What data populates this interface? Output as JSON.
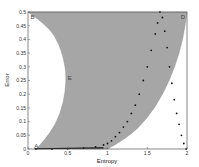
{
  "chart_data": {
    "type": "scatter",
    "title": "",
    "xlabel": "Entropy",
    "ylabel": "Error",
    "xlim": [
      0,
      2
    ],
    "ylim": [
      0,
      0.5
    ],
    "grid": false,
    "xticks": [
      "0",
      "0.5",
      "1",
      "1.5",
      "2"
    ],
    "yticks": [
      "0",
      "0.05",
      "0.1",
      "0.15",
      "0.2",
      "0.25",
      "0.3",
      "0.35",
      "0.4",
      "0.45",
      "0.5"
    ],
    "region": {
      "name": "feasible region",
      "color": "#a6a6a6",
      "left_boundary": [
        [
          0,
          0.5
        ],
        [
          0.25,
          0.45
        ],
        [
          0.4,
          0.38
        ],
        [
          0.47,
          0.3
        ],
        [
          0.48,
          0.25
        ],
        [
          0.45,
          0.17
        ],
        [
          0.35,
          0.09
        ],
        [
          0.2,
          0.03
        ],
        [
          0.1,
          0
        ]
      ],
      "right_boundary": [
        [
          1.0,
          0
        ],
        [
          1.25,
          0.04
        ],
        [
          1.5,
          0.11
        ],
        [
          1.7,
          0.2
        ],
        [
          1.85,
          0.3
        ],
        [
          1.95,
          0.4
        ],
        [
          2.0,
          0.5
        ]
      ]
    },
    "series": [
      {
        "name": "dotted curve",
        "color": "#111111",
        "x": [
          0.1,
          0.3,
          0.5,
          0.7,
          0.85,
          0.95,
          1.0,
          1.05,
          1.1,
          1.15,
          1.2,
          1.25,
          1.3,
          1.35,
          1.4,
          1.45,
          1.5,
          1.55,
          1.6,
          1.63,
          1.66,
          1.69,
          1.72,
          1.75,
          1.78,
          1.81,
          1.84,
          1.87,
          1.9,
          1.93,
          1.96,
          1.99
        ],
        "y": [
          0.0,
          0.0,
          0.001,
          0.003,
          0.008,
          0.015,
          0.02,
          0.03,
          0.045,
          0.06,
          0.08,
          0.1,
          0.13,
          0.16,
          0.2,
          0.25,
          0.3,
          0.36,
          0.42,
          0.46,
          0.5,
          0.48,
          0.43,
          0.37,
          0.3,
          0.24,
          0.18,
          0.13,
          0.09,
          0.05,
          0.02,
          0.0
        ]
      }
    ],
    "annotations": [
      {
        "text": "A",
        "x": 0.08,
        "y": 0.01
      },
      {
        "text": "B",
        "x": 0.03,
        "y": 0.48
      },
      {
        "text": "E",
        "x": 0.5,
        "y": 0.26
      },
      {
        "text": "D",
        "x": 1.92,
        "y": 0.48
      }
    ]
  }
}
